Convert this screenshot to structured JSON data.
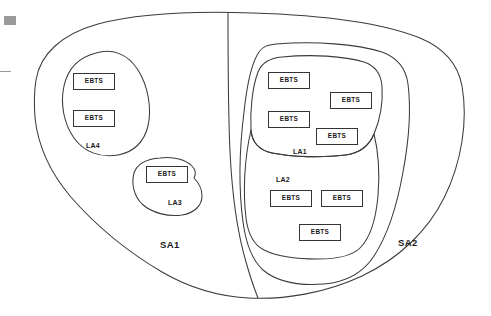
{
  "diagram": {
    "node_label": "EBTS",
    "service_areas": [
      {
        "id": "sa1",
        "label": "SA1",
        "x": 160,
        "y": 240
      },
      {
        "id": "sa2",
        "label": "SA2",
        "x": 398,
        "y": 238
      }
    ],
    "local_areas": [
      {
        "id": "la4",
        "label": "LA4",
        "x": 86,
        "y": 142
      },
      {
        "id": "la3",
        "label": "LA3",
        "x": 168,
        "y": 199
      },
      {
        "id": "la1",
        "label": "LA1",
        "x": 293,
        "y": 148
      },
      {
        "id": "la2",
        "label": "LA2",
        "x": 276,
        "y": 176
      }
    ],
    "nodes": [
      {
        "id": "ebts-la4-1",
        "area": "LA4",
        "label": "EBTS",
        "x": 73,
        "y": 73,
        "w": 42,
        "h": 17
      },
      {
        "id": "ebts-la4-2",
        "area": "LA4",
        "label": "EBTS",
        "x": 73,
        "y": 110,
        "w": 42,
        "h": 17
      },
      {
        "id": "ebts-la3-1",
        "area": "LA3",
        "label": "EBTS",
        "x": 146,
        "y": 166,
        "w": 42,
        "h": 17
      },
      {
        "id": "ebts-la1-1",
        "area": "LA1",
        "label": "EBTS",
        "x": 268,
        "y": 72,
        "w": 42,
        "h": 17
      },
      {
        "id": "ebts-la1-2",
        "area": "LA1",
        "label": "EBTS",
        "x": 268,
        "y": 111,
        "w": 42,
        "h": 17
      },
      {
        "id": "ebts-la1-3",
        "area": "LA1",
        "label": "EBTS",
        "x": 330,
        "y": 92,
        "w": 42,
        "h": 17
      },
      {
        "id": "ebts-la1-4",
        "area": "LA1",
        "label": "EBTS",
        "x": 316,
        "y": 128,
        "w": 42,
        "h": 17
      },
      {
        "id": "ebts-la2-1",
        "area": "LA2",
        "label": "EBTS",
        "x": 270,
        "y": 190,
        "w": 42,
        "h": 17
      },
      {
        "id": "ebts-la2-2",
        "area": "LA2",
        "label": "EBTS",
        "x": 321,
        "y": 190,
        "w": 42,
        "h": 17
      },
      {
        "id": "ebts-la2-3",
        "area": "LA2",
        "label": "EBTS",
        "x": 299,
        "y": 224,
        "w": 42,
        "h": 17
      }
    ],
    "colors": {
      "stroke": "#3b3b3b",
      "node_border": "#343434",
      "text": "#1a1a1a",
      "background": "#ffffff",
      "scan_mark": "#9a9a9a"
    }
  }
}
